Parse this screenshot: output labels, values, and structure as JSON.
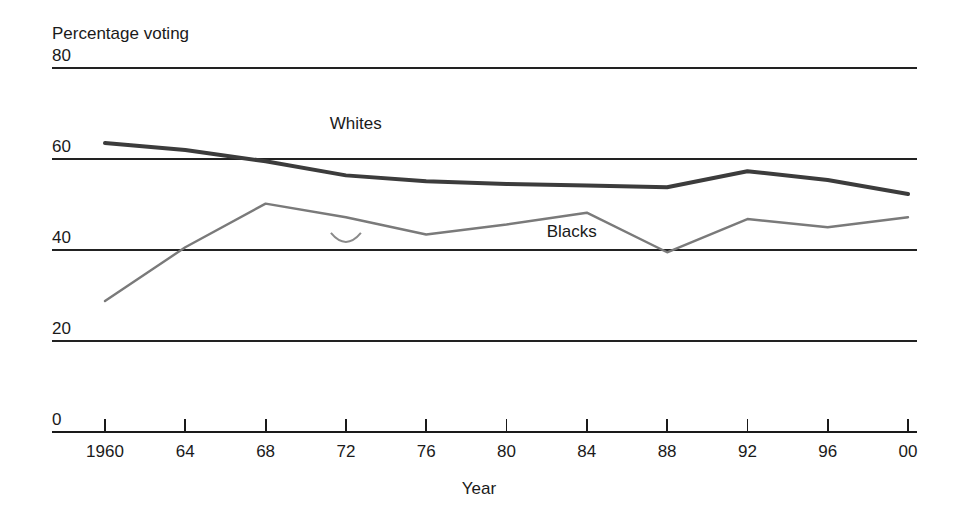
{
  "chart_data": {
    "type": "line",
    "title": "",
    "ylabel": "Percentage voting",
    "xlabel": "Year",
    "x": [
      1960,
      1964,
      1968,
      1972,
      1976,
      1980,
      1984,
      1988,
      1992,
      1996,
      2000
    ],
    "categories": [
      "1960",
      "64",
      "68",
      "72",
      "76",
      "80",
      "84",
      "88",
      "92",
      "96",
      "00"
    ],
    "ylim": [
      0,
      80
    ],
    "yticks": [
      0,
      20,
      40,
      60,
      80
    ],
    "ytick_labels": [
      "0",
      "20",
      "40",
      "60",
      "80"
    ],
    "grid": "horizontal",
    "legend": "inline-labels",
    "series": [
      {
        "name": "Whites",
        "color": "#3c3c3c",
        "width": 4,
        "label_x": 1971.2,
        "label_y": 66.5,
        "values": [
          63.5,
          62.0,
          59.5,
          56.4,
          55.1,
          54.5,
          54.2,
          53.8,
          57.3,
          55.4,
          52.3
        ]
      },
      {
        "name": "Blacks",
        "color": "#7a7a7a",
        "width": 2.4,
        "label_x": 1982.0,
        "label_y": 42.8,
        "values": [
          28.8,
          40.6,
          50.2,
          47.2,
          43.4,
          45.6,
          48.2,
          39.5,
          46.8,
          45.0,
          47.2
        ]
      }
    ],
    "artifact": {
      "name": "scan-smudge",
      "x": 1972.0,
      "y": 42.0
    }
  }
}
